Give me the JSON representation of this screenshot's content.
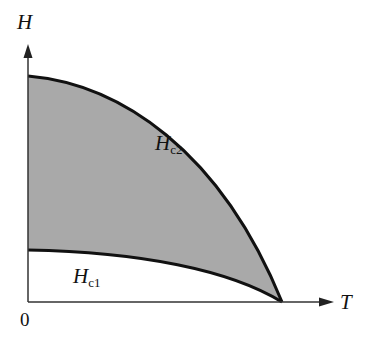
{
  "diagram": {
    "axes": {
      "y_label": "H",
      "x_label": "T",
      "origin_label": "0"
    },
    "curves": [
      {
        "name": "Hc2",
        "label_main": "H",
        "label_sub": "c2",
        "description": "upper critical field"
      },
      {
        "name": "Hc1",
        "label_main": "H",
        "label_sub": "c1",
        "description": "lower critical field"
      }
    ],
    "regions": [
      {
        "name": "mixed-state",
        "between": [
          "Hc1",
          "Hc2"
        ],
        "fill": "#a9a9a9"
      }
    ],
    "colors": {
      "line": "#111111",
      "fill": "#a9a9a9",
      "background": "#ffffff"
    }
  }
}
